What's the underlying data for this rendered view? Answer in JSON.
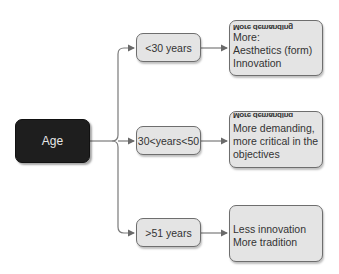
{
  "diagram": {
    "root": {
      "label": "Age"
    },
    "branches": [
      {
        "label": "<30 years",
        "detail_garbled": "More demanding",
        "detail_lines": [
          "More:",
          "Aesthetics (form)",
          "Innovation"
        ]
      },
      {
        "label": "30<years<50",
        "detail_garbled": "More demanding",
        "detail_lines": [
          "More demanding,",
          "more critical in the",
          "objectives"
        ]
      },
      {
        "label": ">51 years",
        "detail_lines": [
          "Less innovation",
          "More tradition"
        ]
      }
    ],
    "colors": {
      "root_fill": "#1e1e1e",
      "root_text": "#e8e8e8",
      "node_fill": "#e4e4e4",
      "node_border": "#6e6e6e",
      "connector": "#7a7a7a"
    }
  }
}
